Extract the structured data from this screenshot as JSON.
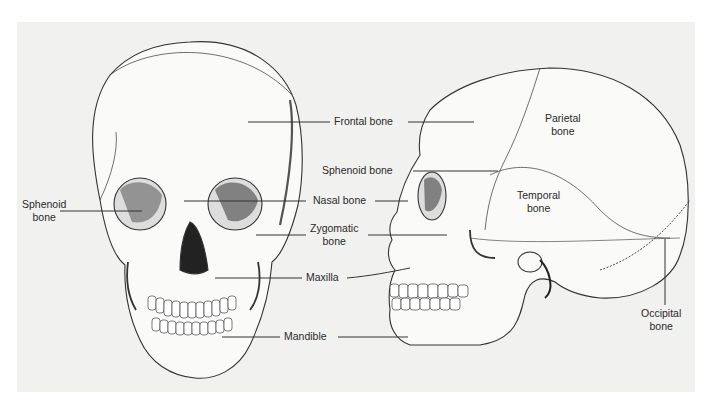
{
  "figure": {
    "type": "anatomical illustration",
    "views": [
      "anterior view of skull",
      "lateral view of skull"
    ],
    "colors": {
      "background": "#ffffff",
      "panel": "#f1f1f0",
      "ink": "#2a2a2a",
      "bone": "#fafaf8",
      "shadow": "#3a3a3a"
    }
  },
  "labels": {
    "frontal": "Frontal bone",
    "sphenoid_center": "Sphenoid bone",
    "sphenoid_left_1": "Sphenoid",
    "sphenoid_left_2": "bone",
    "nasal": "Nasal bone",
    "zygomatic_1": "Zygomatic",
    "zygomatic_2": "bone",
    "maxilla": "Maxilla",
    "mandible": "Mandible",
    "parietal_1": "Parietal",
    "parietal_2": "bone",
    "temporal_1": "Temporal",
    "temporal_2": "bone",
    "occipital_1": "Occipital",
    "occipital_2": "bone"
  }
}
